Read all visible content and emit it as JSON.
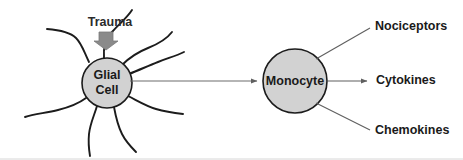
{
  "figure": {
    "background_color": "#ffffff",
    "width": 463,
    "height": 160
  },
  "stimulus": {
    "label": "Trauma",
    "arrow_icon": "down-arrow-icon",
    "arrow_color": "#8a8a8a"
  },
  "nodes": [
    {
      "id": "glial-cell",
      "line1": "Glial",
      "line2": "Cell",
      "fill_color": "#d2d2d2",
      "stroke_color": "#1c1c1c",
      "cx": 107,
      "cy": 83,
      "r": 25
    },
    {
      "id": "monocyte",
      "line1": "Monocyte",
      "line2": "",
      "fill_color": "#d2d2d2",
      "stroke_color": "#1c1c1c",
      "cx": 295,
      "cy": 81,
      "r": 32
    }
  ],
  "outputs": [
    {
      "id": "nociceptors",
      "label": "Nociceptors",
      "arrow": false
    },
    {
      "id": "cytokines",
      "label": "Cytokines",
      "arrow": true
    },
    {
      "id": "chemokines",
      "label": "Chemokines",
      "arrow": false
    }
  ],
  "connection": {
    "from": "glial-cell",
    "to": "monocyte",
    "arrow": true,
    "color": "#6d6d6d"
  }
}
